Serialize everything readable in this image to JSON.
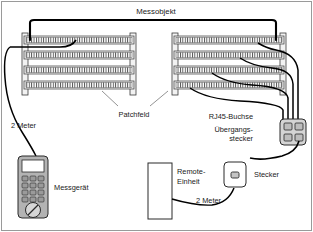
{
  "figure": {
    "title": "Messobjekt",
    "background_color": "#ffffff",
    "line_color": "#1a1a1a",
    "cable_color": "#000000",
    "panel_fill": "#f2f2f2",
    "device_fill": "#b3b3b3",
    "frame_color": "#9a9a9a"
  },
  "labels": {
    "measurement_object": "Messobjekt",
    "patch_panel": "Patchfeld",
    "rj45_socket": "RJ45-Buchse",
    "adapter_plug_line1": "Übergangs-",
    "adapter_plug_line2": "stecker",
    "meter_left": "2 Meter",
    "meter_right": "2 Meter",
    "measuring_device": "Messgerät",
    "remote_unit_line1": "Remote-",
    "remote_unit_line2": "Einheit",
    "plug": "Stecker"
  },
  "components": {
    "patch_panel_left": {
      "name": "Patchfeld links",
      "rows": 4,
      "ports_per_row": 24
    },
    "patch_panel_right": {
      "name": "Patchfeld rechts",
      "rows": 4,
      "ports_per_row": 24
    },
    "adapter_block": {
      "name": "Übergangsstecker",
      "ports": 4,
      "incoming_cables": 4
    },
    "measuring_device": {
      "name": "Messgerät",
      "keypad_rows": 4,
      "keypad_cols": 3,
      "has_display": true,
      "has_dial": true
    },
    "remote_unit": {
      "name": "Remote-Einheit"
    },
    "plug": {
      "name": "Stecker",
      "ports": 1
    }
  },
  "cables": {
    "top_link_label": "Messobjekt",
    "measuring_cable_length": "2 Meter",
    "remote_cable_length": "2 Meter",
    "patch_cables_count": 4
  }
}
